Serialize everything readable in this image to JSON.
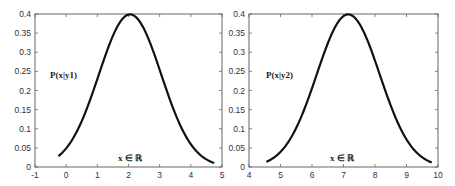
{
  "chart_data": [
    {
      "type": "line",
      "title": "",
      "annotation": "P(x|y1)",
      "xlabel_annotation": "x ∈ ℝ",
      "xlim": [
        -1,
        5
      ],
      "ylim": [
        0,
        0.4
      ],
      "xticks": [
        "-1",
        "0",
        "1",
        "2",
        "3",
        "4",
        "5"
      ],
      "yticks": [
        "0",
        "0.05",
        "0.1",
        "0.15",
        "0.2",
        "0.25",
        "0.3",
        "0.35",
        "0.4"
      ],
      "series": [
        {
          "name": "P(x|y1)",
          "distribution": "normal",
          "mean": 2.05,
          "std": 1.0,
          "x_range": [
            -0.25,
            4.75
          ]
        }
      ],
      "grid": false,
      "legend": "none"
    },
    {
      "type": "line",
      "title": "",
      "annotation": "P(x|y2)",
      "xlabel_annotation": "x ∈ ℝ",
      "xlim": [
        4,
        10
      ],
      "ylim": [
        0,
        0.4
      ],
      "xticks": [
        "4",
        "5",
        "6",
        "7",
        "8",
        "9",
        "10"
      ],
      "yticks": [
        "0",
        "0.05",
        "0.1",
        "0.15",
        "0.2",
        "0.25",
        "0.3",
        "0.35",
        "0.4"
      ],
      "series": [
        {
          "name": "P(x|y2)",
          "distribution": "normal",
          "mean": 7.15,
          "std": 1.0,
          "x_range": [
            4.55,
            9.8
          ]
        }
      ],
      "grid": false,
      "legend": "none"
    }
  ],
  "colors": {
    "curve": "#111111",
    "axis": "#666666",
    "text": "#333333"
  }
}
